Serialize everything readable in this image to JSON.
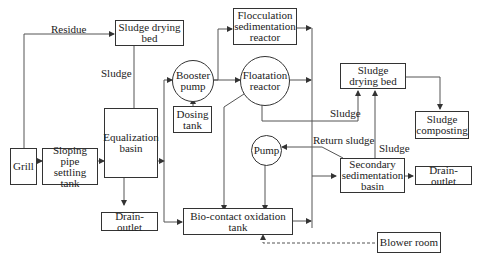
{
  "nodes": {
    "grill": "Grill",
    "sloping_tank": "Sloping pipe settling tank",
    "equalization": "Equalization basin",
    "drying_bed_top": "Sludge drying bed",
    "drain_left": "Drain-outlet",
    "booster_pump": "Booster pump",
    "dosing_tank": "Dosing tank",
    "flocculation": "Flocculation sedimentation reactor",
    "floatation": "Floatation reactor",
    "pump": "Pump",
    "bio_contact": "Bio-contact oxidation tank",
    "drying_bed_right": "Sludge drying bed",
    "composting": "Sludge composting",
    "secondary": "Secondary sedimentation basin",
    "drain_right": "Drain-outlet",
    "blower": "Blower room"
  },
  "labels": {
    "residue": "Residue",
    "sludge_eq": "Sludge",
    "sludge_float": "Sludge",
    "return_sludge": "Return sludge",
    "sludge_secondary": "Sludge"
  },
  "colors": {
    "line": "#555555",
    "box_border": "#333333"
  }
}
